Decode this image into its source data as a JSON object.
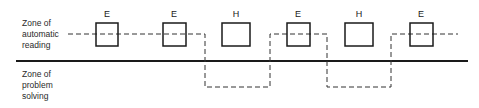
{
  "diagram": {
    "zones": {
      "upper": {
        "lines": [
          "Zone of",
          "automatic",
          "reading"
        ]
      },
      "lower": {
        "lines": [
          "Zone of",
          "problem",
          "solving"
        ]
      }
    },
    "boxes": [
      {
        "label": "E",
        "x": 96,
        "w": 22,
        "crossed": true
      },
      {
        "label": "E",
        "x": 163,
        "w": 23,
        "crossed": true
      },
      {
        "label": "H",
        "x": 222,
        "w": 28,
        "crossed": false
      },
      {
        "label": "E",
        "x": 287,
        "w": 23,
        "crossed": true
      },
      {
        "label": "H",
        "x": 345,
        "w": 28,
        "crossed": false
      },
      {
        "label": "E",
        "x": 410,
        "w": 23,
        "crossed": true
      }
    ],
    "colors": {
      "line": "#1a1a1a",
      "dashed": "#333333",
      "background": "#ffffff"
    }
  }
}
